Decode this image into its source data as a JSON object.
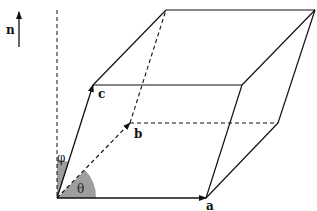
{
  "diagram": {
    "type": "parallelepiped unit cell",
    "labels": {
      "normal": "n",
      "vector_a": "a",
      "vector_b": "b",
      "vector_c": "c",
      "angle_theta": "θ",
      "angle_phi": "φ"
    },
    "colors": {
      "line": "#111111",
      "angle_fill": "#9e9e9e",
      "background": "#ffffff"
    }
  }
}
